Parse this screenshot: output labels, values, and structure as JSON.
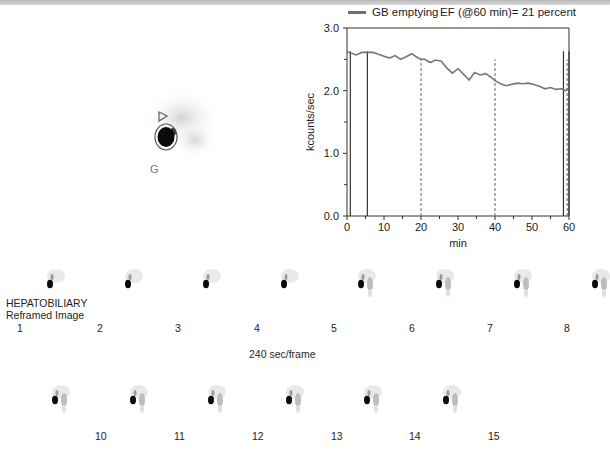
{
  "header_band": "",
  "static_image": {
    "label": "G",
    "description": "gallbladder ROI with bile duct marker"
  },
  "chart_data": {
    "type": "line",
    "title": "",
    "legend": [
      {
        "name": "GB emptying",
        "color": "#6e6e6e"
      }
    ],
    "legend_placement": "top",
    "annotation": "EF (@60 min)= 21 percent",
    "xlabel": "min",
    "ylabel": "kcounts/sec",
    "xlim": [
      0,
      60
    ],
    "ylim": [
      0,
      3.0
    ],
    "xticks": [
      0,
      10,
      20,
      30,
      40,
      50,
      60
    ],
    "xtick_labels": [
      "0",
      "10",
      "20",
      "30",
      "40",
      "50",
      "60"
    ],
    "xminor_step": 5,
    "yticks": [
      0,
      1.0,
      2.0,
      3.0
    ],
    "ytick_labels": [
      "0.0",
      "1.0",
      "2.0",
      "3.0"
    ],
    "yminor_step": 0.5,
    "grid": false,
    "series": [
      {
        "name": "GB emptying",
        "x": [
          0,
          1,
          2.5,
          4,
          5.5,
          7,
          8.5,
          10,
          11.5,
          13,
          14.5,
          16,
          17.5,
          19,
          20,
          21,
          22.5,
          24,
          25.5,
          27,
          28.5,
          30,
          31.5,
          33,
          34.5,
          36,
          37.5,
          39,
          40,
          41.5,
          43,
          44.5,
          46,
          47.5,
          49,
          50.5,
          52,
          53.5,
          55,
          56.5,
          58,
          59,
          60
        ],
        "values": [
          2.62,
          2.6,
          2.57,
          2.61,
          2.61,
          2.61,
          2.58,
          2.55,
          2.52,
          2.56,
          2.5,
          2.54,
          2.59,
          2.53,
          2.5,
          2.5,
          2.45,
          2.49,
          2.47,
          2.36,
          2.28,
          2.35,
          2.26,
          2.17,
          2.29,
          2.25,
          2.27,
          2.21,
          2.16,
          2.11,
          2.08,
          2.1,
          2.12,
          2.11,
          2.12,
          2.1,
          2.07,
          2.03,
          2.05,
          2.02,
          2.03,
          2.0,
          2.05
        ]
      }
    ],
    "vlines_solid": [
      0.9,
      5.5,
      58.5,
      60
    ],
    "vlines_dashed": [
      20,
      40,
      59.5
    ]
  },
  "frames": {
    "title_line1": "HEPATOBILIARY",
    "title_line2": "Reframed Image",
    "timing": "240 sec/frame",
    "row1_labels": [
      "1",
      "2",
      "3",
      "4",
      "5",
      "6",
      "7",
      "8"
    ],
    "row2_labels": [
      "10",
      "11",
      "12",
      "13",
      "14",
      "15"
    ]
  }
}
